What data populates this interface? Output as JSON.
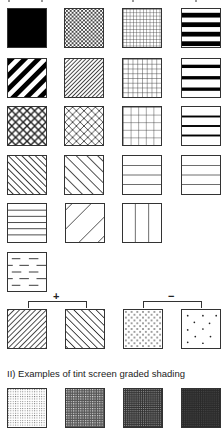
{
  "section_ii": {
    "caption": "II) Examples of tint screen graded shading"
  },
  "brackets": {
    "plus": {
      "sign": "+"
    },
    "minus": {
      "sign": "−"
    }
  },
  "colors": {
    "ink": "#333333",
    "black": "#000000",
    "background": "#ffffff"
  },
  "patterns": {
    "rows": [
      [
        "solid-black",
        "fine-crosshatch-diamond",
        "fine-grid",
        "thick-horizontal-stripes"
      ],
      [
        "thick-diagonal-stripes",
        "fine-diagonal-lines",
        "medium-grid",
        "medium-horizontal-stripes"
      ],
      [
        "bold-diamond-crosshatch",
        "diamond-crosshatch",
        "coarse-grid",
        "thin-horizontal-stripes"
      ],
      [
        "dense-backslash-lines",
        "sparse-backslash-lines",
        "wide-horizontal-lines",
        "wide-horizontal-lines-2"
      ],
      [
        "close-horizontal-lines",
        "wide-diagonal-lines",
        "vertical-lines"
      ],
      [
        "dashed-lines"
      ]
    ],
    "graded_plus": [
      "dense-diagonal-lines",
      "medium-backslash-lines"
    ],
    "graded_minus": [
      "dense-dots",
      "sparse-dots"
    ],
    "tint_screens": [
      "tint-light",
      "tint-medium",
      "tint-dark",
      "tint-darkest"
    ]
  }
}
